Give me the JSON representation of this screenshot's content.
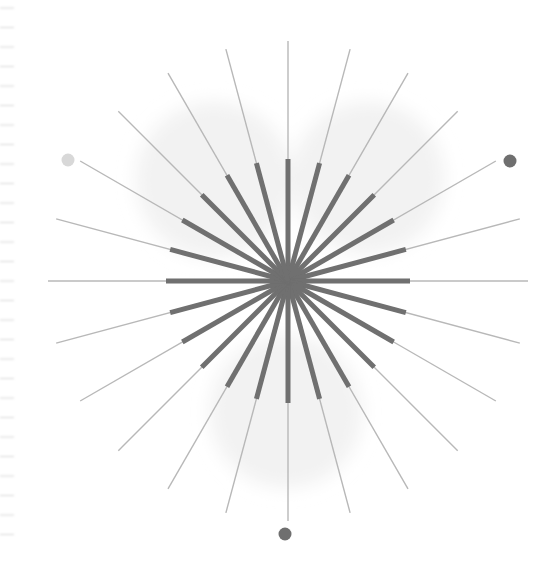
{
  "canvas": {
    "width": 560,
    "height": 561,
    "background": "#ffffff",
    "title": "Radial starburst line figure"
  },
  "chart_data": {
    "type": "scatter",
    "title": "",
    "subtitle": "",
    "xlabel": "",
    "ylabel": "",
    "grid": false,
    "legend": null,
    "center": {
      "x": 288,
      "y": 281
    },
    "ray_count": 24,
    "angle_step_deg": 15,
    "angle_offset_deg": -90,
    "series": [
      {
        "name": "outer-thin-rays",
        "style": "line",
        "color": "#b8b8b8",
        "stroke_width": 1.4,
        "inner_radius": 0,
        "outer_radius": 240,
        "values": [
          0,
          15,
          30,
          45,
          60,
          75,
          90,
          105,
          120,
          135,
          150,
          165,
          180,
          195,
          210,
          225,
          240,
          255,
          270,
          285,
          300,
          315,
          330,
          345
        ]
      },
      {
        "name": "inner-thick-rays",
        "style": "line",
        "color": "#6f6f6f",
        "stroke_width": 5,
        "inner_radius": 0,
        "outer_radius": 122,
        "values": [
          0,
          15,
          30,
          45,
          60,
          75,
          90,
          105,
          120,
          135,
          150,
          165,
          180,
          195,
          210,
          225,
          240,
          255,
          270,
          285,
          300,
          315,
          330,
          345
        ]
      }
    ],
    "background_blobs": [
      {
        "name": "blob-upper-left",
        "cx": 214,
        "cy": 180,
        "r": 78,
        "color": "#f2f2f2"
      },
      {
        "name": "blob-upper-right",
        "cx": 368,
        "cy": 178,
        "r": 76,
        "color": "#f2f2f2"
      },
      {
        "name": "blob-bottom",
        "cx": 286,
        "cy": 412,
        "r": 76,
        "color": "#f2f2f2"
      }
    ],
    "markers": [
      {
        "name": "marker-left",
        "cx": 68,
        "cy": 160,
        "r": 6.5,
        "color": "#d8d8d8"
      },
      {
        "name": "marker-right",
        "cx": 510,
        "cy": 161,
        "r": 6.5,
        "color": "#6f6f6f"
      },
      {
        "name": "marker-bottom",
        "cx": 285,
        "cy": 534,
        "r": 6.5,
        "color": "#6f6f6f"
      }
    ],
    "axis_ticks": {
      "name": "left-edge-tick-marks",
      "orientation": "vertical",
      "x_start": 0,
      "x_end": 14,
      "y_start": 8,
      "spacing": 19.5,
      "count": 28,
      "color": "#d6d6d6",
      "stroke_width": 1
    }
  }
}
